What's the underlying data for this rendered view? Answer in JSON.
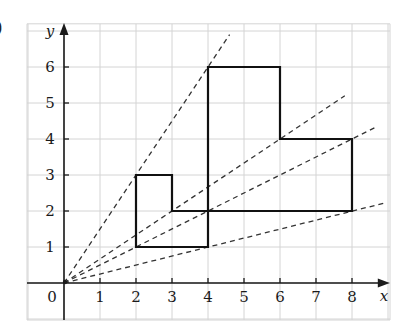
{
  "part_label": ")",
  "chart_data": {
    "type": "diagram",
    "title": "",
    "xlabel": "x",
    "ylabel": "y",
    "origin_label": "0",
    "x_ticks": [
      "1",
      "2",
      "3",
      "4",
      "5",
      "6",
      "7",
      "8"
    ],
    "y_ticks": [
      "1",
      "2",
      "3",
      "4",
      "5",
      "6"
    ],
    "xlim": [
      -1,
      9
    ],
    "ylim": [
      -1,
      7.2
    ],
    "grid": true,
    "shapes": [
      {
        "name": "small-shape",
        "vertices": [
          [
            2,
            1
          ],
          [
            4,
            1
          ],
          [
            4,
            2
          ],
          [
            3,
            2
          ],
          [
            3,
            3
          ],
          [
            2,
            3
          ]
        ],
        "style": "solid"
      },
      {
        "name": "large-shape",
        "vertices": [
          [
            4,
            2
          ],
          [
            8,
            2
          ],
          [
            8,
            4
          ],
          [
            6,
            4
          ],
          [
            6,
            6
          ],
          [
            4,
            6
          ]
        ],
        "style": "solid"
      }
    ],
    "rays": [
      {
        "from": [
          0,
          0
        ],
        "to": [
          4.6,
          6.9
        ],
        "through": [
          [
            2,
            3
          ],
          [
            4,
            6
          ]
        ],
        "style": "dashed"
      },
      {
        "from": [
          0,
          0
        ],
        "to": [
          7.8,
          5.2
        ],
        "through": [
          [
            3,
            2
          ],
          [
            6,
            4
          ]
        ],
        "style": "dashed"
      },
      {
        "from": [
          0,
          0
        ],
        "to": [
          8.7,
          4.35
        ],
        "through": [
          [
            4,
            2
          ],
          [
            8,
            4
          ]
        ],
        "style": "dashed"
      },
      {
        "from": [
          0,
          0
        ],
        "to": [
          8.9,
          2.22
        ],
        "through": [
          [
            4,
            1
          ],
          [
            8,
            2
          ]
        ],
        "style": "dashed"
      }
    ]
  },
  "colors": {
    "grid": "#d4d4d4",
    "axis": "#1a1a1a",
    "shape": "#111111",
    "ray": "#333333"
  }
}
